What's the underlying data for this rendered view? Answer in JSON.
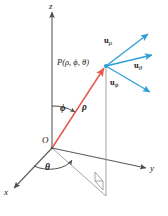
{
  "figure": {
    "background_color": "#ffffff",
    "width": 168,
    "height": 216
  },
  "colors": {
    "axis": "#5a5a5a",
    "grid": "#8c8c8c",
    "radial_vector": "#e8584a",
    "unit_vector": "#2f9fd8",
    "text": "#1a1a1a"
  },
  "axes": [
    {
      "name": "z-axis",
      "label": "z",
      "direction": "up"
    },
    {
      "name": "y-axis",
      "label": "y",
      "direction": "right"
    },
    {
      "name": "x-axis",
      "label": "x",
      "direction": "lower-left"
    }
  ],
  "origin": {
    "label": "O"
  },
  "point": {
    "label": "P(ρ, ϕ, θ)",
    "name": "point-p"
  },
  "angles": [
    {
      "name": "phi",
      "label": "ϕ",
      "description": "polar angle from z-axis"
    },
    {
      "name": "theta",
      "label": "θ",
      "description": "azimuthal angle from x-axis in xy-plane"
    }
  ],
  "radial": {
    "label": "ρ",
    "description": "radial distance from origin to P",
    "color": "#e8584a"
  },
  "unit_vectors": [
    {
      "name": "u-rho",
      "base": "u",
      "sub": "ρ",
      "direction": "up-right"
    },
    {
      "name": "u-theta",
      "base": "u",
      "sub": "θ",
      "direction": "right"
    },
    {
      "name": "u-phi",
      "base": "u",
      "sub": "ϕ",
      "direction": "down-right"
    }
  ],
  "markers": {
    "right_angle": "right-angle-square-in-xy-plane",
    "projection_line": "vertical dashed drop from P to xy-plane"
  }
}
